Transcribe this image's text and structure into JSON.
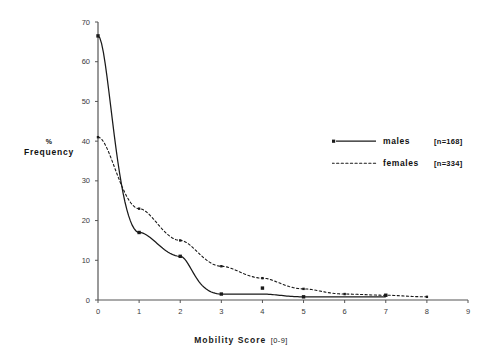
{
  "chart_data": {
    "type": "line",
    "title": "",
    "xlabel": "Mobility Score",
    "xlabel_range": "[0-9]",
    "ylabel_pct": "%",
    "ylabel_main": "Frequency",
    "ylabel_full": "% Frequency",
    "x": [
      0,
      1,
      2,
      3,
      4,
      5,
      6,
      7,
      8,
      9
    ],
    "xticks": [
      "0",
      "1",
      "2",
      "3",
      "4",
      "5",
      "6",
      "7",
      "8",
      "9"
    ],
    "yticks": [
      "0",
      "10",
      "20",
      "30",
      "40",
      "50",
      "60",
      "70"
    ],
    "xlim": [
      0,
      9
    ],
    "ylim": [
      0,
      70
    ],
    "grid": false,
    "legend_position": "right-center",
    "series": [
      {
        "name": "males",
        "n_label": "[n=168]",
        "n": 168,
        "style": "solid",
        "marker": "square",
        "color": "#1a1a1a",
        "x": [
          0,
          1,
          2,
          3,
          4,
          5,
          7
        ],
        "values": [
          66.5,
          17.0,
          11.0,
          1.5,
          3.0,
          0.8,
          1.2
        ]
      },
      {
        "name": "females",
        "n_label": "[n=334]",
        "n": 334,
        "style": "dotted",
        "marker": "small-square",
        "color": "#1a1a1a",
        "x": [
          0,
          1,
          2,
          3,
          4,
          5,
          6,
          7,
          8
        ],
        "values": [
          41.0,
          23.0,
          15.0,
          8.5,
          5.5,
          2.8,
          1.5,
          1.2,
          0.8
        ]
      }
    ]
  },
  "legend": {
    "males_label": "males",
    "males_n": "[n=168]",
    "females_label": "females",
    "females_n": "[n=334]"
  }
}
